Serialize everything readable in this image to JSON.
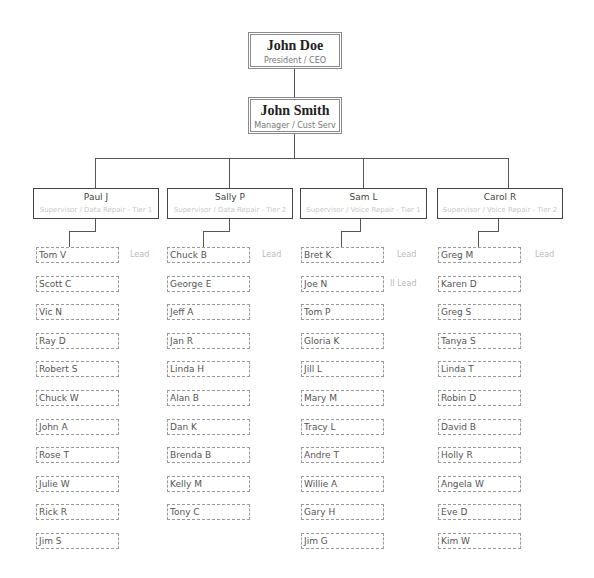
{
  "org_chart": {
    "ceo": {
      "name": "John Doe",
      "title": "President / CEO"
    },
    "manager": {
      "name": "John Smith",
      "title": "Manager / Cust Serv"
    },
    "supervisors": [
      {
        "name": "Paul J",
        "title": "Supervisor / Data Repair - Tier 1",
        "staff": [
          {
            "name": "Tom V",
            "role": "Lead"
          },
          {
            "name": "Scott C",
            "role": ""
          },
          {
            "name": "Vic N",
            "role": ""
          },
          {
            "name": "Ray D",
            "role": ""
          },
          {
            "name": "Robert S",
            "role": ""
          },
          {
            "name": "Chuck W",
            "role": ""
          },
          {
            "name": "John A",
            "role": ""
          },
          {
            "name": "Rose T",
            "role": ""
          },
          {
            "name": "Julie W",
            "role": ""
          },
          {
            "name": "Rick R",
            "role": ""
          },
          {
            "name": "Jim S",
            "role": ""
          }
        ]
      },
      {
        "name": "Sally P",
        "title": "Supervisor / Data Repair - Tier 2",
        "staff": [
          {
            "name": "Chuck B",
            "role": "Lead"
          },
          {
            "name": "George E",
            "role": ""
          },
          {
            "name": "Jeff A",
            "role": ""
          },
          {
            "name": "Jan R",
            "role": ""
          },
          {
            "name": "Linda H",
            "role": ""
          },
          {
            "name": "Alan B",
            "role": ""
          },
          {
            "name": "Dan K",
            "role": ""
          },
          {
            "name": "Brenda B",
            "role": ""
          },
          {
            "name": "Kelly M",
            "role": ""
          },
          {
            "name": "Tony C",
            "role": ""
          }
        ]
      },
      {
        "name": "Sam L",
        "title": "Supervisor / Voice Repair - Tier 1",
        "staff": [
          {
            "name": "Bret K",
            "role": "Lead"
          },
          {
            "name": "Joe N",
            "role": "II Lead"
          },
          {
            "name": "Tom P",
            "role": ""
          },
          {
            "name": "Gloria K",
            "role": ""
          },
          {
            "name": "Jill L",
            "role": ""
          },
          {
            "name": "Mary M",
            "role": ""
          },
          {
            "name": "Tracy L",
            "role": ""
          },
          {
            "name": "Andre T",
            "role": ""
          },
          {
            "name": "Willie A",
            "role": ""
          },
          {
            "name": "Gary H",
            "role": ""
          },
          {
            "name": "Jim G",
            "role": ""
          }
        ]
      },
      {
        "name": "Carol R",
        "title": "Supervisor / Voice Repair - Tier 2",
        "staff": [
          {
            "name": "Greg M",
            "role": "Lead"
          },
          {
            "name": "Karen D",
            "role": ""
          },
          {
            "name": "Greg S",
            "role": ""
          },
          {
            "name": "Tanya S",
            "role": ""
          },
          {
            "name": "Linda T",
            "role": ""
          },
          {
            "name": "Robin D",
            "role": ""
          },
          {
            "name": "David B",
            "role": ""
          },
          {
            "name": "Holly R",
            "role": ""
          },
          {
            "name": "Angela W",
            "role": ""
          },
          {
            "name": "Eve D",
            "role": ""
          },
          {
            "name": "Kim W",
            "role": ""
          }
        ]
      }
    ]
  },
  "colors": {
    "connector": "#555555",
    "exec_border": "#8a8a8a",
    "supervisor_border": "#444444",
    "staff_border_dashed": "#9a9a9a",
    "muted_text": "#bbbbbb"
  }
}
